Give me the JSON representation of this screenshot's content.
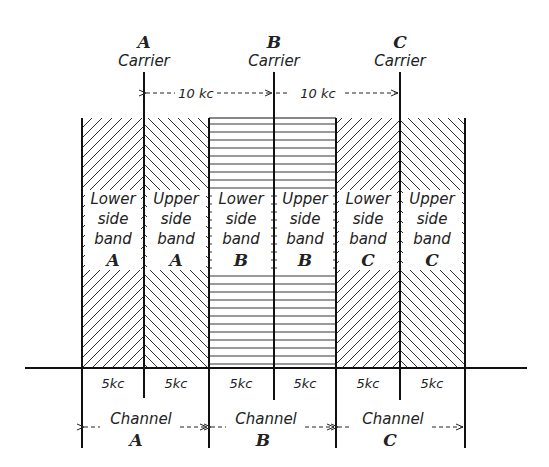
{
  "carriers": [
    {
      "letter": "A",
      "label": "Carrier"
    },
    {
      "letter": "B",
      "label": "Carrier"
    },
    {
      "letter": "C",
      "label": "Carrier"
    }
  ],
  "spacing_labels": [
    "10 kc",
    "10 kc"
  ],
  "bands": [
    {
      "line1": "Lower",
      "line2": "side",
      "line3": "band",
      "letter": "A",
      "width": "5kc"
    },
    {
      "line1": "Upper",
      "line2": "side",
      "line3": "band",
      "letter": "A",
      "width": "5kc"
    },
    {
      "line1": "Lower",
      "line2": "side",
      "line3": "band",
      "letter": "B",
      "width": "5kc"
    },
    {
      "line1": "Upper",
      "line2": "side",
      "line3": "band",
      "letter": "B",
      "width": "5kc"
    },
    {
      "line1": "Lower",
      "line2": "side",
      "line3": "band",
      "letter": "C",
      "width": "5kc"
    },
    {
      "line1": "Upper",
      "line2": "side",
      "line3": "band",
      "letter": "C",
      "width": "5kc"
    }
  ],
  "channels": [
    {
      "label": "Channel",
      "letter": "A"
    },
    {
      "label": "Channel",
      "letter": "B"
    },
    {
      "label": "Channel",
      "letter": "C"
    }
  ]
}
